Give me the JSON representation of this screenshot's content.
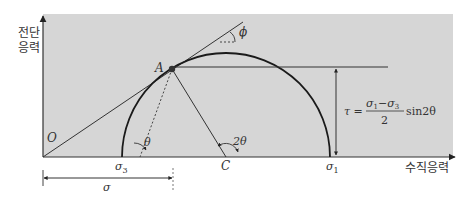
{
  "axes": {
    "y_label_line1": "전단",
    "y_label_line2": "응력",
    "x_label": "수직응력"
  },
  "points": {
    "origin": "O",
    "point_a": "A",
    "center": "C"
  },
  "stress_labels": {
    "sigma_3": "σ",
    "sigma_3_sub": "3",
    "sigma_1": "σ",
    "sigma_1_sub": "1",
    "sigma": "σ"
  },
  "angles": {
    "phi": "ϕ",
    "theta": "θ",
    "two_theta": "2θ"
  },
  "formula": {
    "lhs": "τ =",
    "numerator_s1": "σ",
    "numerator_s1_sub": "1",
    "minus": "−",
    "numerator_s3": "σ",
    "numerator_s3_sub": "3",
    "denominator": "2",
    "trig": "sin2θ"
  },
  "colors": {
    "panel": "#d6d6d6",
    "line": "#2a2a2a",
    "circle": "#1a1a1a"
  }
}
